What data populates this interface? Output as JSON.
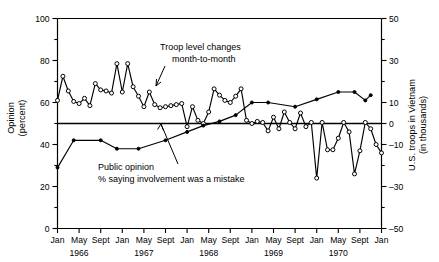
{
  "figure": {
    "width": 439,
    "height": 262,
    "background": "#ffffff",
    "foreground": "#000000"
  },
  "annotations": {
    "troop": {
      "line1": "Troop level changes",
      "line2": "month-to-month"
    },
    "opinion": {
      "line1": "Public opinion",
      "line2": "% saying involvement was a mistake"
    }
  },
  "axes": {
    "left": {
      "title_line1": "Opinion",
      "title_line2": "(percent)",
      "ticks": [
        0,
        20,
        40,
        60,
        80,
        100
      ],
      "minor_ticks": [
        10,
        30,
        50,
        70,
        90
      ],
      "range": [
        0,
        100
      ]
    },
    "right": {
      "title_line1": "U.S. troops in Vietnam",
      "title_line2": "(in thousands)",
      "ticks": [
        -50,
        -30,
        -10,
        0,
        10,
        30,
        50
      ],
      "minor_ticks": [
        -40,
        -20,
        20,
        40
      ],
      "range": [
        -50,
        50
      ]
    },
    "bottom": {
      "month_labels": [
        "Jan",
        "May",
        "Sept",
        "Jan",
        "May",
        "Sept",
        "Jan",
        "May",
        "Sept",
        "Jan",
        "May",
        "Sept",
        "Jan",
        "May",
        "Sept",
        "Jan"
      ],
      "year_labels": [
        "1966",
        "1967",
        "1968",
        "1969",
        "1970"
      ],
      "range": [
        0,
        60
      ]
    }
  },
  "chart_data": {
    "type": "line",
    "title": "",
    "xlabel": "",
    "ylabel": "Opinion (percent)",
    "y2label": "U.S. troops in Vietnam (in thousands)",
    "ylim": [
      0,
      100
    ],
    "y2lim": [
      -50,
      50
    ],
    "xlim": [
      0,
      60
    ],
    "grid": false,
    "legend": "annotations",
    "zero_reference_left": 50,
    "zero_reference_right": 0,
    "x_months": [
      "1966-01",
      "1966-02",
      "1966-03",
      "1966-04",
      "1966-05",
      "1966-06",
      "1966-07",
      "1966-08",
      "1966-09",
      "1966-10",
      "1966-11",
      "1966-12",
      "1967-01",
      "1967-02",
      "1967-03",
      "1967-04",
      "1967-05",
      "1967-06",
      "1967-07",
      "1967-08",
      "1967-09",
      "1967-10",
      "1967-11",
      "1967-12",
      "1968-01",
      "1968-02",
      "1968-03",
      "1968-04",
      "1968-05",
      "1968-06",
      "1968-07",
      "1968-08",
      "1968-09",
      "1968-10",
      "1968-11",
      "1968-12",
      "1969-01",
      "1969-02",
      "1969-03",
      "1969-04",
      "1969-05",
      "1969-06",
      "1969-07",
      "1969-08",
      "1969-09",
      "1969-10",
      "1969-11",
      "1969-12",
      "1970-01",
      "1970-02",
      "1970-03",
      "1970-04",
      "1970-05",
      "1970-06",
      "1970-07",
      "1970-08",
      "1970-09",
      "1970-10",
      "1970-11",
      "1970-12",
      "1971-01"
    ],
    "series": [
      {
        "name": "Troop level changes month-to-month",
        "axis": "right",
        "units": "thousands",
        "marker": "open-circle",
        "x_index": [
          0,
          1,
          2,
          3,
          4,
          5,
          6,
          7,
          8,
          9,
          10,
          11,
          12,
          13,
          14,
          15,
          16,
          17,
          18,
          19,
          20,
          21,
          22,
          23,
          24,
          25,
          26,
          27,
          28,
          29,
          30,
          31,
          32,
          33,
          34,
          35,
          36,
          37,
          38,
          39,
          40,
          41,
          42,
          43,
          44,
          45,
          46,
          47,
          48,
          49,
          50,
          51,
          52,
          53,
          54,
          55,
          56,
          57,
          58,
          59,
          60
        ],
        "values_right_axis": [
          11.0,
          22.5,
          15.5,
          10.5,
          9.5,
          12.0,
          8.5,
          19.0,
          16.0,
          15.5,
          14.5,
          28.5,
          15.0,
          28.5,
          17.5,
          13.0,
          8.0,
          15.0,
          9.0,
          7.5,
          8.0,
          8.5,
          9.0,
          9.5,
          -1.5,
          8.0,
          1.5,
          0.0,
          5.5,
          16.5,
          13.5,
          11.0,
          10.0,
          13.0,
          16.5,
          1.5,
          0.0,
          1.0,
          0.5,
          -3.5,
          3.0,
          -2.5,
          5.5,
          0.5,
          -2.5,
          5.0,
          -1.5,
          0.5,
          -26.0,
          0.5,
          -12.5,
          -12.5,
          -7.0,
          0.5,
          -4.0,
          -24.0,
          -13.0,
          0.5,
          -2.5,
          -10.0,
          -14.0
        ],
        "values_left_axis_equivalent": [
          61.0,
          72.5,
          65.5,
          60.5,
          59.5,
          62.0,
          58.5,
          69.0,
          66.0,
          65.5,
          64.5,
          78.5,
          65.0,
          78.5,
          67.5,
          63.0,
          58.0,
          65.0,
          59.0,
          57.5,
          58.0,
          58.5,
          59.0,
          59.5,
          48.5,
          58.0,
          51.5,
          50.0,
          55.5,
          66.5,
          63.5,
          61.0,
          60.0,
          63.0,
          66.5,
          51.5,
          50.0,
          51.0,
          50.5,
          46.5,
          53.0,
          47.5,
          55.5,
          50.5,
          47.5,
          55.0,
          48.5,
          50.5,
          24.0,
          50.5,
          37.5,
          37.5,
          43.0,
          50.5,
          46.0,
          26.0,
          37.0,
          50.5,
          47.5,
          40.0,
          36.0
        ]
      },
      {
        "name": "Public opinion % saying involvement was a mistake",
        "axis": "left",
        "units": "percent",
        "marker": "filled-circle",
        "x_index": [
          0,
          3,
          8,
          11,
          15,
          20,
          24,
          27,
          30,
          33,
          36,
          39,
          44,
          48,
          52,
          55,
          57,
          58
        ],
        "values_percent": [
          29.0,
          42.0,
          42.0,
          38.0,
          38.0,
          42.0,
          46.0,
          49.0,
          51.0,
          54.0,
          60.0,
          60.0,
          58.0,
          61.5,
          65.0,
          65.0,
          61.0,
          63.5
        ]
      }
    ]
  }
}
